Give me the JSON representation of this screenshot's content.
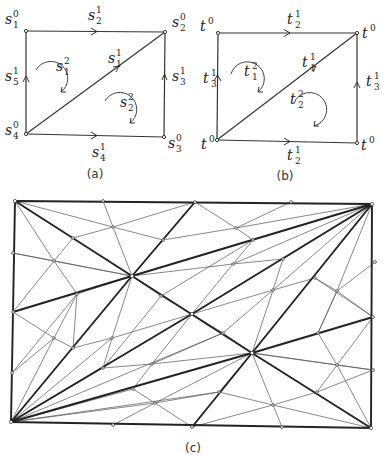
{
  "panels": {
    "a": {
      "caption": "(a)",
      "vertices": [
        {
          "id": "s1_0",
          "base": "s",
          "sub": "1",
          "sup": "0",
          "x": 26,
          "y": 31,
          "lx": 5,
          "ly": 24
        },
        {
          "id": "s2_0",
          "base": "s",
          "sub": "2",
          "sup": "0",
          "x": 165,
          "y": 32,
          "lx": 172,
          "ly": 27
        },
        {
          "id": "s3_0",
          "base": "s",
          "sub": "3",
          "sup": "0",
          "x": 164,
          "y": 137,
          "lx": 168,
          "ly": 148
        },
        {
          "id": "s4_0",
          "base": "s",
          "sub": "4",
          "sup": "0",
          "x": 26,
          "y": 134,
          "lx": 5,
          "ly": 135
        }
      ],
      "edges": [
        {
          "label_base": "s",
          "sub": "2",
          "sup": "1",
          "from": "s1_0",
          "to": "s2_0",
          "lx": 88,
          "ly": 20
        },
        {
          "label_base": "s",
          "sub": "1",
          "sup": "1",
          "from": "s4_0",
          "to": "s2_0",
          "lx": 108,
          "ly": 63
        },
        {
          "label_base": "s",
          "sub": "3",
          "sup": "1",
          "from": "s3_0",
          "to": "s2_0",
          "lx": 172,
          "ly": 81
        },
        {
          "label_base": "s",
          "sub": "4",
          "sup": "1",
          "from": "s4_0",
          "to": "s3_0",
          "lx": 92,
          "ly": 157
        },
        {
          "label_base": "s",
          "sub": "5",
          "sup": "1",
          "from": "s4_0",
          "to": "s1_0",
          "lx": 5,
          "ly": 81
        }
      ],
      "faces": [
        {
          "label_base": "s",
          "sub": "1",
          "sup": "2",
          "lx": 56,
          "ly": 71
        },
        {
          "label_base": "s",
          "sub": "2",
          "sup": "2",
          "lx": 120,
          "ly": 107
        }
      ]
    },
    "b": {
      "caption": "(b)",
      "vertices": [
        {
          "id": "tl",
          "base": "t",
          "sub": "",
          "sup": "0",
          "x": 218,
          "y": 33,
          "lx": 200,
          "ly": 31
        },
        {
          "id": "tr",
          "base": "t",
          "sub": "",
          "sup": "0",
          "x": 357,
          "y": 33,
          "lx": 362,
          "ly": 38
        },
        {
          "id": "br",
          "base": "t",
          "sub": "",
          "sup": "0",
          "x": 357,
          "y": 143,
          "lx": 361,
          "ly": 150
        },
        {
          "id": "bl",
          "base": "t",
          "sub": "",
          "sup": "0",
          "x": 217,
          "y": 140,
          "lx": 201,
          "ly": 149
        }
      ],
      "edges": [
        {
          "label_base": "t",
          "sub": "2",
          "sup": "1",
          "lx": 287,
          "ly": 24
        },
        {
          "label_base": "t",
          "sub": "1",
          "sup": "1",
          "lx": 302,
          "ly": 67
        },
        {
          "label_base": "t",
          "sub": "3",
          "sup": "1",
          "lx": 366,
          "ly": 86
        },
        {
          "label_base": "t",
          "sub": "2",
          "sup": "1",
          "lx": 287,
          "ly": 160
        },
        {
          "label_base": "t",
          "sub": "3",
          "sup": "1",
          "lx": 203,
          "ly": 83
        }
      ],
      "faces": [
        {
          "label_base": "t",
          "sub": "1",
          "sup": "2",
          "lx": 244,
          "ly": 76
        },
        {
          "label_base": "t",
          "sub": "2",
          "sup": "2",
          "lx": 290,
          "ly": 104
        }
      ]
    },
    "c": {
      "caption": "(c)",
      "description": "Subdivided triangulated rectangle; bold edges show the coarse triangulation structure."
    }
  }
}
